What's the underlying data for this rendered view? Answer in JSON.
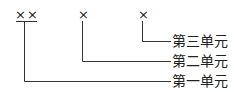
{
  "diagram": {
    "digits": [
      {
        "text": "××",
        "x": 15,
        "y": 8
      },
      {
        "text": "×",
        "x": 79,
        "y": 8
      },
      {
        "text": "×",
        "x": 138,
        "y": 8
      }
    ],
    "labels": [
      {
        "text": "第三单元",
        "x": 172,
        "y": 33
      },
      {
        "text": "第二单元",
        "x": 172,
        "y": 53
      },
      {
        "text": "第一单元",
        "x": 172,
        "y": 73
      }
    ],
    "line_color": "#333333"
  }
}
